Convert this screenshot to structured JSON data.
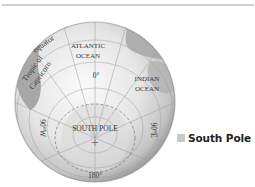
{
  "figure": {
    "type": "orthographic globe view centered on the South Pole",
    "labels": {
      "equator": "equator",
      "tropic_line1": "Tropic of",
      "tropic_line2": "Capricorn",
      "atlantic_line1": "ATLANTIC",
      "atlantic_line2": "OCEAN",
      "indian_line1": "INDIAN",
      "indian_line2": "OCEAN",
      "meridian_0": "0°",
      "meridian_90w": "90°W",
      "meridian_90e": "90°E",
      "meridian_180": "180°",
      "south_pole": "SOUTH POLE",
      "pole_marker": "+"
    }
  },
  "legend": {
    "items": [
      {
        "label": "South Pole",
        "color": "#c8c8c8"
      }
    ]
  },
  "colors": {
    "globe_light": "#f2f2f2",
    "globe_mid": "#d6d6d6",
    "globe_dark": "#8e8e8e",
    "land": "#a9a9a9",
    "grid": "#9a9a9a",
    "rule": "#cfcfcf"
  }
}
